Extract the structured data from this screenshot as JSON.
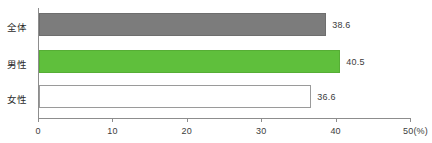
{
  "chart_data": {
    "type": "bar",
    "orientation": "horizontal",
    "title": "",
    "xlabel": "(%)",
    "ylabel": "",
    "categories": [
      "全体",
      "男性",
      "女性"
    ],
    "values": [
      38.6,
      40.5,
      36.6
    ],
    "value_labels": [
      "38.6",
      "40.5",
      "36.6"
    ],
    "bar_colors": [
      "#7c7c7c",
      "#5fbf3c",
      "#ffffff"
    ],
    "bar_border_colors": [
      "#6e6e6e",
      "#56ae35",
      "#9a9a9a"
    ],
    "xlim": [
      0,
      50
    ],
    "xticks": [
      0,
      10,
      20,
      30,
      40,
      50
    ],
    "xtick_labels": [
      "0",
      "10",
      "20",
      "30",
      "40",
      "50(%)"
    ],
    "grid": false,
    "legend": false,
    "axis_color": "#8d8d8d",
    "text_color": "#3c3c3c"
  }
}
